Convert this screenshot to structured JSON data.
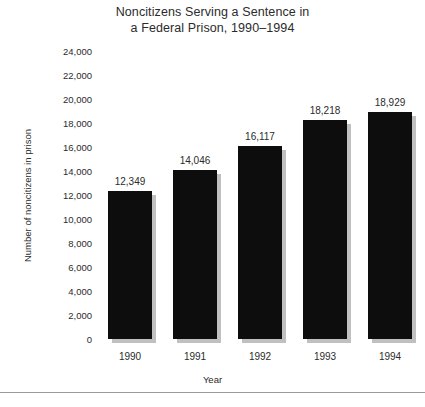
{
  "chart_data": {
    "type": "bar",
    "title": "Noncitizens Serving a Sentence in a Federal Prison, 1990–1994",
    "title_lines": [
      "Noncitizens Serving a Sentence in",
      "a Federal Prison, 1990–1994"
    ],
    "xlabel": "Year",
    "ylabel": "Number of noncitizens in prison",
    "categories": [
      "1990",
      "1991",
      "1992",
      "1993",
      "1994"
    ],
    "values": [
      12349,
      14046,
      16117,
      18218,
      18929
    ],
    "value_labels": [
      "12,349",
      "14,046",
      "16,117",
      "18,218",
      "18,929"
    ],
    "ylim": [
      0,
      24000
    ],
    "ytick_values": [
      24000,
      22000,
      20000,
      18000,
      16000,
      14000,
      12000,
      10000,
      8000,
      6000,
      4000,
      2000,
      0
    ],
    "ytick_labels": [
      "24,000",
      "22,000",
      "20,000",
      "18,000",
      "16,000",
      "14,000",
      "12,000",
      "10,000",
      "8,000",
      "6,000",
      "4,000",
      "2,000",
      "0"
    ],
    "grid": false,
    "legend": false,
    "bar_color": "#0d0d0d",
    "shadow_color": "#8c8c8c",
    "background_color": "#ffffff",
    "text_color": "#2b2b2b"
  }
}
